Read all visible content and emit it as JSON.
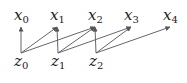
{
  "diagram": {
    "type": "directed-graph",
    "top_nodes": [
      {
        "id": "x0",
        "base": "x",
        "sub": "0",
        "cx": 21
      },
      {
        "id": "x1",
        "base": "x",
        "sub": "1",
        "cx": 57
      },
      {
        "id": "x2",
        "base": "x",
        "sub": "2",
        "cx": 95
      },
      {
        "id": "x3",
        "base": "x",
        "sub": "3",
        "cx": 131
      },
      {
        "id": "x4",
        "base": "x",
        "sub": "4",
        "cx": 170
      }
    ],
    "bottom_nodes": [
      {
        "id": "z0",
        "base": "z",
        "sub": "0",
        "cx": 21
      },
      {
        "id": "z1",
        "base": "z",
        "sub": "1",
        "cx": 58
      },
      {
        "id": "z2",
        "base": "z",
        "sub": "2",
        "cx": 96
      }
    ],
    "edges": [
      [
        "z0",
        "x0"
      ],
      [
        "z0",
        "x1"
      ],
      [
        "z0",
        "x2"
      ],
      [
        "z1",
        "x1"
      ],
      [
        "z1",
        "x2"
      ],
      [
        "z1",
        "x3"
      ],
      [
        "z2",
        "x2"
      ],
      [
        "z2",
        "x3"
      ],
      [
        "z2",
        "x4"
      ]
    ],
    "colors": {
      "edge": "#666666",
      "text": "#222222",
      "background": "#ffffff"
    }
  }
}
